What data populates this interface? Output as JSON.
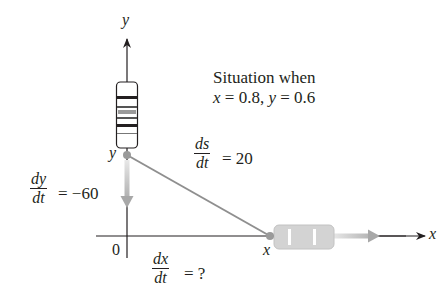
{
  "diagram": {
    "type": "related-rates",
    "axes": {
      "x_label": "x",
      "y_label": "y",
      "origin_label": "0"
    },
    "points": {
      "y_point_label": "y",
      "x_point_label": "x"
    },
    "situation": {
      "line1": "Situation when",
      "line2_x": "x",
      "line2_eq1": " = 0.8, ",
      "line2_y": "y",
      "line2_eq2": " = 0.6"
    },
    "rates": {
      "ds_dt": {
        "num": "ds",
        "den": "dt",
        "value": "= 20"
      },
      "dy_dt": {
        "num": "dy",
        "den": "dt",
        "value": "= −60"
      },
      "dx_dt": {
        "num": "dx",
        "den": "dt",
        "value": "= ?"
      }
    },
    "objects": [
      {
        "name": "car-vertical",
        "moving": "down along y-axis"
      },
      {
        "name": "car-horizontal",
        "moving": "right along x-axis"
      }
    ],
    "colors": {
      "axis": "#231f20",
      "line": "#8f8f8f",
      "dot": "#9a9a9a",
      "car_fill": "#d6d6d6",
      "arrow_gray": "#b8b8b8"
    }
  }
}
